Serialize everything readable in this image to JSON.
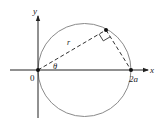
{
  "diagram": {
    "type": "polar-circle",
    "labels": {
      "y_axis": "y",
      "x_axis": "x",
      "origin": "0",
      "diameter_end": "2a",
      "radius": "r",
      "angle": "θ"
    },
    "colors": {
      "axes": "#222222",
      "circle": "#8a8a8a",
      "dashed": "#333333",
      "points": "#111111"
    },
    "geometry": {
      "origin": [
        38,
        70
      ],
      "diameter_end": [
        131,
        70
      ],
      "circle_center": [
        84.5,
        70
      ],
      "circle_radius": 46,
      "point": [
        106,
        30
      ]
    }
  }
}
